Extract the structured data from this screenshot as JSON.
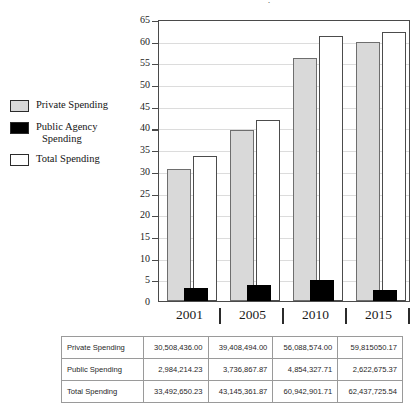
{
  "title_remnant": "·",
  "legend": {
    "items": [
      {
        "label": "Private Spending",
        "label2": "",
        "swatch": "gray-swatch",
        "color": "#d9d9d9"
      },
      {
        "label": "Public Agency",
        "label2": "Spending",
        "swatch": "black-swatch",
        "color": "#000000"
      },
      {
        "label": "Total Spending",
        "label2": "",
        "swatch": "white-swatch",
        "color": "#ffffff"
      }
    ]
  },
  "axis": {
    "yticks": [
      "0",
      "5",
      "10",
      "15",
      "20",
      "25",
      "30",
      "35",
      "40",
      "45",
      "50",
      "55",
      "60",
      "65"
    ],
    "xlabels": [
      "2001",
      "2005",
      "2010",
      "2015"
    ]
  },
  "chart_data": {
    "type": "bar",
    "title": "",
    "xlabel": "",
    "ylabel": "",
    "ylim": [
      0,
      65
    ],
    "ytick_step": 5,
    "grid": true,
    "legend_position": "left",
    "categories": [
      "2001",
      "2005",
      "2010",
      "2015"
    ],
    "series": [
      {
        "name": "Private Spending",
        "color": "#d9d9d9",
        "values": [
          30.5,
          39.4,
          56.1,
          59.8
        ]
      },
      {
        "name": "Public Agency Spending",
        "color": "#000000",
        "values": [
          3.0,
          3.7,
          4.9,
          2.6
        ]
      },
      {
        "name": "Total Spending",
        "color": "#ffffff",
        "values": [
          33.5,
          41.8,
          61.0,
          62.0
        ]
      }
    ]
  },
  "table": {
    "rows": [
      {
        "header": "Private Spending",
        "values": [
          "30,508,436.00",
          "39,408,494.00",
          "56,088,574.00",
          "59,815050.17"
        ]
      },
      {
        "header": "Public Spending",
        "values": [
          "2,984,214.23",
          "3,736,867.87",
          "4,854,327.71",
          "2,622,675.37"
        ]
      },
      {
        "header": "Total Spending",
        "values": [
          "33,492,650.23",
          "43,145,361.87",
          "60,942,901.71",
          "62,437,725.54"
        ]
      }
    ]
  }
}
